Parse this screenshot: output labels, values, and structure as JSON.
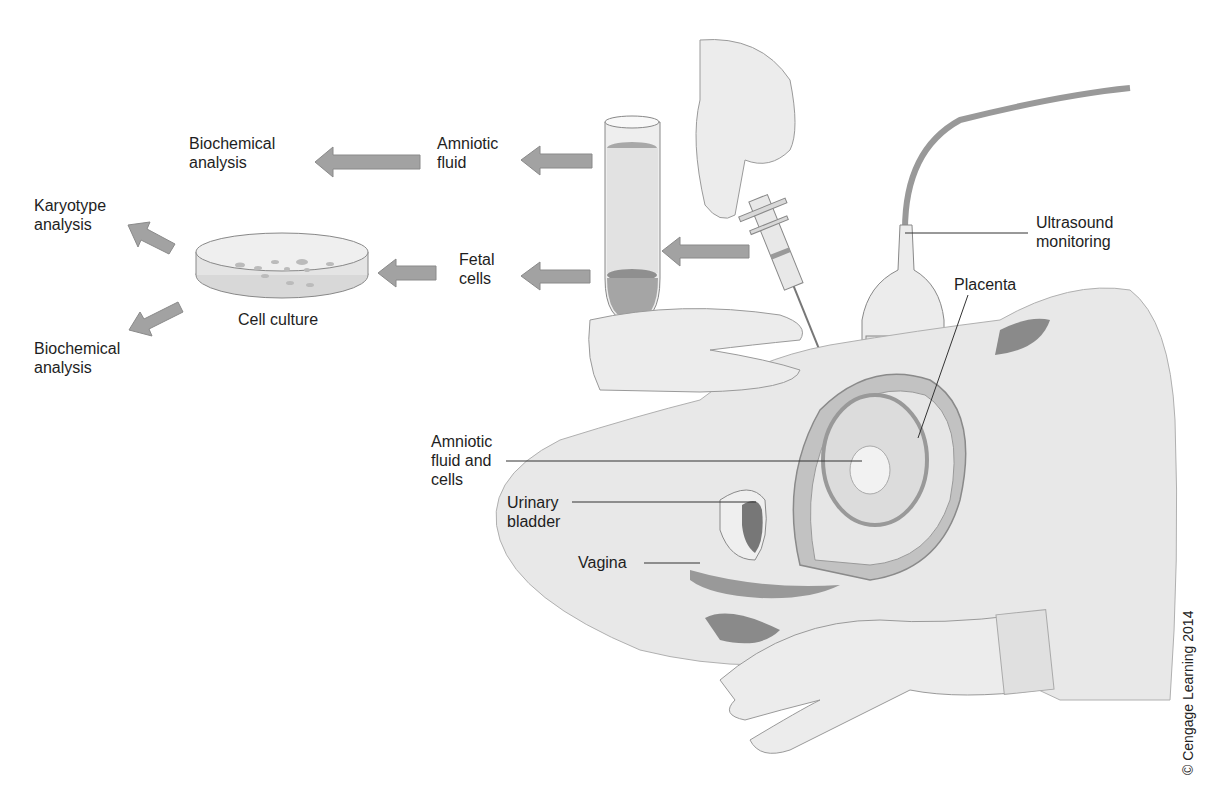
{
  "figure": {
    "copyright": "© Cengage Learning 2014"
  },
  "labels": {
    "biochemical_analysis_top": "Biochemical\nanalysis",
    "amniotic_fluid": "Amniotic\nfluid",
    "karyotype_analysis": "Karyotype\nanalysis",
    "fetal_cells": "Fetal\ncells",
    "cell_culture": "Cell culture",
    "biochemical_analysis_bottom": "Biochemical\nanalysis",
    "ultrasound_monitoring": "Ultrasound\nmonitoring",
    "placenta": "Placenta",
    "amniotic_fluid_and_cells": "Amniotic\nfluid and\ncells",
    "urinary_bladder": "Urinary\nbladder",
    "vagina": "Vagina"
  },
  "colors": {
    "arrow": "#9a9a9a",
    "skin": "#e6e6e6",
    "tissue_dark": "#8a8a8a",
    "tissue_mid": "#b5b5b5",
    "line": "#333333"
  }
}
